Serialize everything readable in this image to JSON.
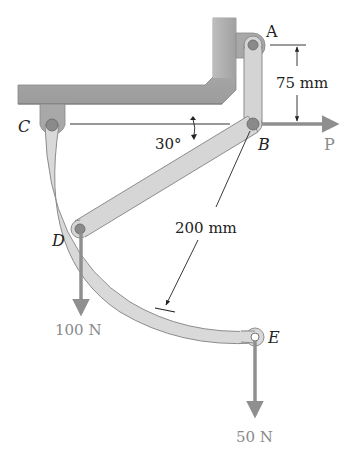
{
  "figure": {
    "type": "mechanism-diagram",
    "points": {
      "A": {
        "label": "A"
      },
      "B": {
        "label": "B"
      },
      "C": {
        "label": "C"
      },
      "D": {
        "label": "D"
      },
      "E": {
        "label": "E"
      }
    },
    "dimensions": {
      "vertical_AB": "75 mm",
      "radius": "200 mm",
      "angle": "30°"
    },
    "loads": {
      "P": {
        "label": "P",
        "direction": "right"
      },
      "D_load": {
        "label": "100 N",
        "direction": "down"
      },
      "E_load": {
        "label": "50 N",
        "direction": "down"
      }
    },
    "colors": {
      "member_fill": "#d9d9d9",
      "member_edge": "#8c8c8c",
      "frame_fill": "#a9a9a9",
      "force_arrow": "#8f8f8f",
      "text": "#222222",
      "force_text": "#8a8a8a"
    }
  }
}
